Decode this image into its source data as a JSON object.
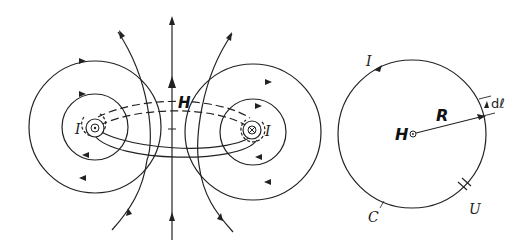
{
  "figure": {
    "left_panel": {
      "description": "Magnetic field lines around a circular current loop",
      "labels": {
        "field": "H",
        "current_left": "I",
        "current_right": "I"
      },
      "symbols": {
        "left_conductor": "current-out-of-page (dot)",
        "right_conductor": "current-into-page (cross)"
      }
    },
    "right_panel": {
      "description": "Circular loop of radius R with line element dl",
      "labels": {
        "current": "I",
        "radius": "R",
        "field": "H",
        "line_element": "dℓ",
        "voltage": "U",
        "curve": "C"
      }
    }
  }
}
